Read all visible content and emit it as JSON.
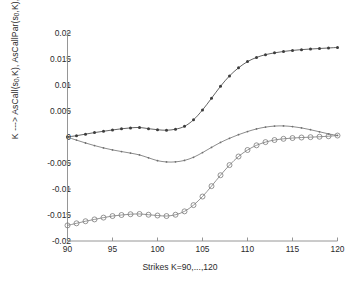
{
  "chart_data": {
    "type": "line",
    "title": "",
    "xlabel": "Strikes K=90,...,120",
    "ylabel": "K ---> AsCall(s0,K), AsCallPar(s0,K), InterAsCall(s0,K)",
    "xlim": [
      90,
      120
    ],
    "ylim": [
      -0.02,
      0.02
    ],
    "xticks": [
      90,
      95,
      100,
      105,
      110,
      115,
      120
    ],
    "yticks": [
      0.02,
      0.015,
      0.01,
      0.005,
      0,
      -0.005,
      -0.01,
      -0.015,
      -0.02
    ],
    "ytick_labels": [
      "0.02",
      "0.015",
      "0.01",
      "0.005",
      "0",
      "-0.005",
      "-0.01",
      "-0.015",
      "-0.02"
    ],
    "xtick_labels": [
      "90",
      "95",
      "100",
      "105",
      "110",
      "115",
      "120"
    ],
    "grid": false,
    "legend": "none",
    "x": [
      90,
      91,
      92,
      93,
      94,
      95,
      96,
      97,
      98,
      99,
      100,
      101,
      102,
      103,
      104,
      105,
      106,
      107,
      108,
      109,
      110,
      111,
      112,
      113,
      114,
      115,
      116,
      117,
      118,
      119,
      120
    ],
    "series": [
      {
        "name": "InterAsCall(s0,K)",
        "marker": "filled-dot",
        "color": "#3c3c3c",
        "values": [
          2e-05,
          0.00025,
          0.00055,
          0.00085,
          0.0011,
          0.00135,
          0.00158,
          0.00175,
          0.00183,
          0.0016,
          0.0014,
          0.0013,
          0.0015,
          0.00205,
          0.0033,
          0.0052,
          0.00745,
          0.00975,
          0.01175,
          0.0133,
          0.0145,
          0.0153,
          0.01583,
          0.01618,
          0.01645,
          0.01665,
          0.0168,
          0.01692,
          0.01702,
          0.01712,
          0.01722
        ]
      },
      {
        "name": "AsCallPar(s0,K)",
        "marker": "small-dot",
        "color": "#6f6f6f",
        "values": [
          -5e-05,
          -0.0006,
          -0.00115,
          -0.00165,
          -0.0021,
          -0.00248,
          -0.0028,
          -0.0031,
          -0.00345,
          -0.004,
          -0.00455,
          -0.0048,
          -0.00478,
          -0.0045,
          -0.0039,
          -0.003,
          -0.002,
          -0.00105,
          -0.00025,
          0.00045,
          0.00105,
          0.00155,
          0.0019,
          0.0021,
          0.00213,
          0.002,
          0.00175,
          0.0014,
          0.001,
          0.0006,
          0.0003
        ]
      },
      {
        "name": "AsCall(s0,K)",
        "marker": "open-circle",
        "color": "#7a7a7a",
        "values": [
          -0.017,
          -0.0166,
          -0.0162,
          -0.01585,
          -0.0155,
          -0.0152,
          -0.015,
          -0.01485,
          -0.0148,
          -0.01495,
          -0.0151,
          -0.0152,
          -0.01495,
          -0.0143,
          -0.0131,
          -0.01145,
          -0.00945,
          -0.00735,
          -0.0054,
          -0.00375,
          -0.0025,
          -0.0016,
          -0.00098,
          -0.00058,
          -0.00035,
          -0.0002,
          -0.0001,
          -3e-05,
          5e-05,
          0.00015,
          0.00028
        ]
      }
    ]
  },
  "axis_label_parts": {
    "y_prefix": "K ---> AsCall(s",
    "y_sub1": "0",
    "y_mid1": ",K), AsCallPar(s",
    "y_sub2": "0",
    "y_mid2": ",K), InterAsCall(s",
    "y_sub3": "0",
    "y_suffix": ",K)"
  },
  "style": {
    "axis_color": "#8a8a8a",
    "background": "#ffffff",
    "text_color": "#2b2b2b"
  }
}
